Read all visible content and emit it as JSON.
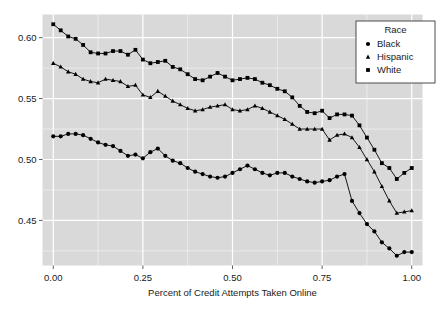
{
  "chart_data": {
    "type": "line",
    "title": "",
    "xlabel": "Percent of Credit Attempts Taken Online",
    "ylabel": "",
    "xlim": [
      -0.03,
      1.03
    ],
    "ylim": [
      0.413,
      0.619
    ],
    "xticks": [
      0.0,
      0.25,
      0.5,
      0.75,
      1.0
    ],
    "xticklabels": [
      "0.00",
      "0.25",
      "0.50",
      "0.75",
      "1.00"
    ],
    "yticks": [
      0.45,
      0.5,
      0.55,
      0.6
    ],
    "yticklabels": [
      "0.45",
      "0.50",
      "0.55",
      "0.60"
    ],
    "grid": true,
    "grid_color": "#ffffff",
    "panel_background": "#d9d9d9",
    "legend": {
      "title": "Race",
      "position": "top-right",
      "entries": [
        {
          "name": "Black",
          "marker": "circle"
        },
        {
          "name": "Hispanic",
          "marker": "triangle"
        },
        {
          "name": "White",
          "marker": "square"
        }
      ]
    },
    "x": [
      0.0,
      0.0208,
      0.0417,
      0.0625,
      0.0833,
      0.1042,
      0.125,
      0.1458,
      0.1667,
      0.1875,
      0.2083,
      0.2292,
      0.25,
      0.2708,
      0.2917,
      0.3125,
      0.3333,
      0.3542,
      0.375,
      0.3958,
      0.4167,
      0.4375,
      0.4583,
      0.4792,
      0.5,
      0.5208,
      0.5417,
      0.5625,
      0.5833,
      0.6042,
      0.625,
      0.6458,
      0.6667,
      0.6875,
      0.7083,
      0.7292,
      0.75,
      0.7708,
      0.7917,
      0.8125,
      0.8333,
      0.8542,
      0.875,
      0.8958,
      0.9167,
      0.9375,
      0.9583,
      0.9792,
      1.0
    ],
    "series": [
      {
        "name": "White",
        "marker": "square",
        "color": "#000000",
        "values": [
          0.611,
          0.606,
          0.601,
          0.599,
          0.594,
          0.588,
          0.587,
          0.587,
          0.589,
          0.589,
          0.586,
          0.59,
          0.582,
          0.579,
          0.58,
          0.581,
          0.576,
          0.574,
          0.57,
          0.566,
          0.565,
          0.568,
          0.571,
          0.568,
          0.565,
          0.566,
          0.567,
          0.566,
          0.563,
          0.561,
          0.558,
          0.556,
          0.551,
          0.544,
          0.539,
          0.538,
          0.54,
          0.534,
          0.537,
          0.537,
          0.536,
          0.528,
          0.518,
          0.508,
          0.497,
          0.493,
          0.484,
          0.489,
          0.493
        ]
      },
      {
        "name": "Hispanic",
        "marker": "triangle",
        "color": "#000000",
        "values": [
          0.579,
          0.576,
          0.572,
          0.57,
          0.566,
          0.564,
          0.563,
          0.566,
          0.565,
          0.564,
          0.56,
          0.561,
          0.553,
          0.551,
          0.556,
          0.552,
          0.548,
          0.545,
          0.542,
          0.54,
          0.541,
          0.543,
          0.544,
          0.545,
          0.541,
          0.54,
          0.541,
          0.544,
          0.542,
          0.539,
          0.536,
          0.533,
          0.529,
          0.525,
          0.525,
          0.525,
          0.525,
          0.516,
          0.52,
          0.521,
          0.518,
          0.51,
          0.5,
          0.49,
          0.478,
          0.466,
          0.456,
          0.457,
          0.458
        ]
      },
      {
        "name": "Black",
        "marker": "circle",
        "color": "#000000",
        "values": [
          0.519,
          0.519,
          0.521,
          0.521,
          0.52,
          0.517,
          0.514,
          0.512,
          0.511,
          0.507,
          0.503,
          0.504,
          0.501,
          0.506,
          0.509,
          0.503,
          0.499,
          0.497,
          0.493,
          0.49,
          0.488,
          0.486,
          0.485,
          0.486,
          0.489,
          0.492,
          0.495,
          0.492,
          0.489,
          0.487,
          0.489,
          0.489,
          0.486,
          0.484,
          0.482,
          0.481,
          0.482,
          0.483,
          0.486,
          0.488,
          0.483,
          0.476,
          0.472,
          0.475,
          0.478,
          0.476,
          0.471,
          0.465,
          0.458
        ]
      }
    ],
    "black_tail": {
      "note": "Black series continues to lower right",
      "x": [
        0.8333,
        0.8542,
        0.875,
        0.8958,
        0.9167,
        0.9375,
        0.9583,
        0.9792,
        1.0
      ],
      "values": [
        0.466,
        0.456,
        0.447,
        0.441,
        0.432,
        0.427,
        0.421,
        0.424,
        0.424
      ]
    }
  }
}
